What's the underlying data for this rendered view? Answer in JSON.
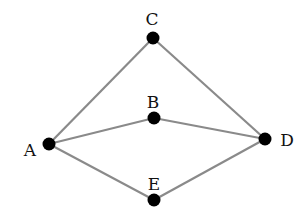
{
  "diagram": {
    "type": "graph",
    "nodes": [
      {
        "id": "A",
        "label": "A",
        "x": 49,
        "y": 144,
        "lx": 30,
        "ly": 156
      },
      {
        "id": "B",
        "label": "B",
        "x": 154,
        "y": 118,
        "lx": 153,
        "ly": 108
      },
      {
        "id": "C",
        "label": "C",
        "x": 153,
        "y": 38,
        "lx": 152,
        "ly": 25
      },
      {
        "id": "D",
        "label": "D",
        "x": 265,
        "y": 139,
        "lx": 287,
        "ly": 146
      },
      {
        "id": "E",
        "label": "E",
        "x": 154,
        "y": 200,
        "lx": 154,
        "ly": 190
      }
    ],
    "edges": [
      [
        "A",
        "C"
      ],
      [
        "C",
        "D"
      ],
      [
        "A",
        "B"
      ],
      [
        "B",
        "D"
      ],
      [
        "A",
        "E"
      ],
      [
        "E",
        "D"
      ]
    ],
    "colors": {
      "edge": "#8a8a8a",
      "node": "#000000",
      "label": "#111111"
    }
  }
}
